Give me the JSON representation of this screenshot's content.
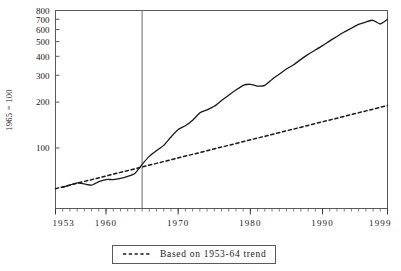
{
  "chart_data": {
    "type": "line",
    "title": "",
    "subtitle": "",
    "xlabel": "",
    "ylabel": "1965 = 100",
    "yscale": "log",
    "ylim": [
      40,
      800
    ],
    "xlim": [
      1953,
      1999
    ],
    "grid": false,
    "legend_position": "below-center",
    "y_ticks": [
      100,
      200,
      300,
      400,
      500,
      600,
      700,
      800
    ],
    "y_tick_labels": [
      "100",
      "200",
      "300",
      "400",
      "500",
      "600",
      "700",
      "800"
    ],
    "x_ticks": [
      1953,
      1960,
      1970,
      1980,
      1990,
      1999
    ],
    "x_tick_labels": [
      "1953",
      "1960",
      "1970",
      "1980",
      "1990",
      "1999"
    ],
    "x_minor_tick_step": 1,
    "annotations": [
      {
        "name": "reference-line-1965",
        "type": "vline",
        "x": 1965
      }
    ],
    "series": [
      {
        "name": "Index series",
        "style": "solid",
        "color": "#1a1a1a",
        "legend_shown": false,
        "x": [
          1954,
          1955,
          1956,
          1957,
          1958,
          1959,
          1960,
          1961,
          1962,
          1963,
          1964,
          1965,
          1966,
          1967,
          1968,
          1969,
          1970,
          1971,
          1972,
          1973,
          1974,
          1975,
          1976,
          1977,
          1978,
          1979,
          1980,
          1981,
          1982,
          1983,
          1984,
          1985,
          1986,
          1987,
          1988,
          1989,
          1990,
          1991,
          1992,
          1993,
          1994,
          1995,
          1996,
          1997,
          1998,
          1999
        ],
        "values": [
          55,
          57,
          59,
          58,
          57,
          60,
          62,
          62,
          63,
          65,
          68,
          78,
          88,
          96,
          104,
          118,
          132,
          140,
          152,
          170,
          178,
          188,
          205,
          222,
          240,
          258,
          262,
          255,
          258,
          282,
          305,
          330,
          352,
          382,
          412,
          440,
          470,
          505,
          540,
          578,
          612,
          648,
          672,
          690,
          652,
          700
        ]
      },
      {
        "name": "Based on 1953-64 trend",
        "style": "dashed",
        "color": "#1a1a1a",
        "legend_shown": true,
        "x": [
          1953,
          1999
        ],
        "values": [
          54,
          190
        ]
      }
    ]
  },
  "legend": {
    "items": [
      {
        "label": "Based on 1953-64 trend",
        "style": "dashed"
      }
    ]
  }
}
